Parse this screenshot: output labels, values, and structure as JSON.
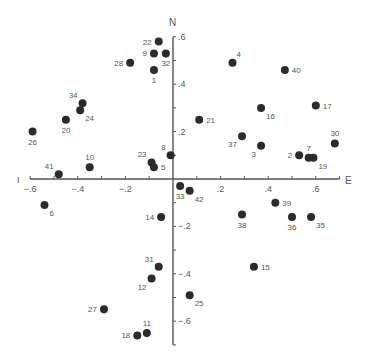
{
  "chart_data": {
    "type": "scatter",
    "title": "",
    "xlabel": "E",
    "ylabel": "N",
    "x_axis_left_label": "I",
    "xlim": [
      -0.6,
      0.7
    ],
    "ylim": [
      -0.7,
      0.6
    ],
    "grid": false,
    "legend": null,
    "x_ticks": [
      -0.6,
      -0.5,
      -0.4,
      -0.3,
      -0.2,
      -0.1,
      0.1,
      0.2,
      0.3,
      0.4,
      0.5,
      0.6,
      0.7
    ],
    "x_tick_labels": [
      {
        "value": -0.6,
        "label": "−.6"
      },
      {
        "value": -0.4,
        "label": "−.4"
      },
      {
        "value": -0.2,
        "label": "−.2"
      },
      {
        "value": 0.2,
        "label": ".2"
      },
      {
        "value": 0.4,
        "label": ".4"
      },
      {
        "value": 0.6,
        "label": ".6"
      }
    ],
    "y_ticks": [
      0.6,
      0.5,
      0.4,
      0.3,
      0.2,
      0.1,
      -0.1,
      -0.2,
      -0.3,
      -0.4,
      -0.5,
      -0.6,
      -0.7
    ],
    "y_tick_labels": [
      {
        "value": 0.6,
        "label": ".6"
      },
      {
        "value": 0.4,
        "label": ".4"
      },
      {
        "value": 0.2,
        "label": ".2"
      },
      {
        "value": -0.2,
        "label": "−.2"
      },
      {
        "value": -0.4,
        "label": "−.4"
      },
      {
        "value": -0.6,
        "label": "−.6"
      }
    ],
    "points": [
      {
        "id": "1",
        "x": -0.08,
        "y": 0.46,
        "label_pos": "below"
      },
      {
        "id": "2",
        "x": 0.53,
        "y": 0.1,
        "label_pos": "left"
      },
      {
        "id": "3",
        "x": 0.37,
        "y": 0.14,
        "label_pos": "below-left"
      },
      {
        "id": "4",
        "x": 0.25,
        "y": 0.49,
        "label_pos": "above-right"
      },
      {
        "id": "5",
        "x": -0.08,
        "y": 0.05,
        "label_pos": "right"
      },
      {
        "id": "6",
        "x": -0.54,
        "y": -0.11,
        "label_pos": "below-right"
      },
      {
        "id": "7",
        "x": 0.57,
        "y": 0.09,
        "label_pos": "above"
      },
      {
        "id": "8",
        "x": -0.01,
        "y": 0.1,
        "label_pos": "above-left"
      },
      {
        "id": "9",
        "x": -0.08,
        "y": 0.53,
        "label_pos": "left"
      },
      {
        "id": "10",
        "x": -0.35,
        "y": 0.05,
        "label_pos": "above"
      },
      {
        "id": "11",
        "x": -0.11,
        "y": -0.65,
        "label_pos": "above"
      },
      {
        "id": "12",
        "x": -0.09,
        "y": -0.42,
        "label_pos": "below-left"
      },
      {
        "id": "14",
        "x": -0.05,
        "y": -0.16,
        "label_pos": "left"
      },
      {
        "id": "15",
        "x": 0.34,
        "y": -0.37,
        "label_pos": "right"
      },
      {
        "id": "16",
        "x": 0.37,
        "y": 0.3,
        "label_pos": "below-right"
      },
      {
        "id": "17",
        "x": 0.6,
        "y": 0.31,
        "label_pos": "right"
      },
      {
        "id": "18",
        "x": -0.15,
        "y": -0.66,
        "label_pos": "left"
      },
      {
        "id": "19",
        "x": 0.59,
        "y": 0.09,
        "label_pos": "below-right"
      },
      {
        "id": "20",
        "x": -0.45,
        "y": 0.25,
        "label_pos": "below"
      },
      {
        "id": "21",
        "x": 0.11,
        "y": 0.25,
        "label_pos": "right"
      },
      {
        "id": "22",
        "x": -0.06,
        "y": 0.58,
        "label_pos": "left"
      },
      {
        "id": "23",
        "x": -0.09,
        "y": 0.07,
        "label_pos": "above-left"
      },
      {
        "id": "24",
        "x": -0.39,
        "y": 0.29,
        "label_pos": "below-right"
      },
      {
        "id": "25",
        "x": 0.07,
        "y": -0.49,
        "label_pos": "below-right"
      },
      {
        "id": "26",
        "x": -0.59,
        "y": 0.2,
        "label_pos": "below"
      },
      {
        "id": "27",
        "x": -0.29,
        "y": -0.55,
        "label_pos": "left"
      },
      {
        "id": "28",
        "x": -0.18,
        "y": 0.49,
        "label_pos": "left"
      },
      {
        "id": "30",
        "x": 0.68,
        "y": 0.15,
        "label_pos": "above"
      },
      {
        "id": "31",
        "x": -0.06,
        "y": -0.37,
        "label_pos": "above-left"
      },
      {
        "id": "32",
        "x": -0.03,
        "y": 0.53,
        "label_pos": "below"
      },
      {
        "id": "33",
        "x": 0.03,
        "y": -0.03,
        "label_pos": "below"
      },
      {
        "id": "34",
        "x": -0.38,
        "y": 0.32,
        "label_pos": "above-left"
      },
      {
        "id": "35",
        "x": 0.58,
        "y": -0.16,
        "label_pos": "below-right"
      },
      {
        "id": "36",
        "x": 0.5,
        "y": -0.16,
        "label_pos": "below"
      },
      {
        "id": "37",
        "x": 0.29,
        "y": 0.18,
        "label_pos": "below-left"
      },
      {
        "id": "38",
        "x": 0.29,
        "y": -0.15,
        "label_pos": "below"
      },
      {
        "id": "39",
        "x": 0.43,
        "y": -0.1,
        "label_pos": "right"
      },
      {
        "id": "40",
        "x": 0.47,
        "y": 0.46,
        "label_pos": "right"
      },
      {
        "id": "41",
        "x": -0.48,
        "y": 0.02,
        "label_pos": "above-left"
      },
      {
        "id": "42",
        "x": 0.07,
        "y": -0.05,
        "label_pos": "below-right"
      }
    ]
  },
  "style": {
    "point_color": "#2b2b2b",
    "axis_color": "#555555",
    "label_color": "#555555",
    "background": "#ffffff"
  }
}
